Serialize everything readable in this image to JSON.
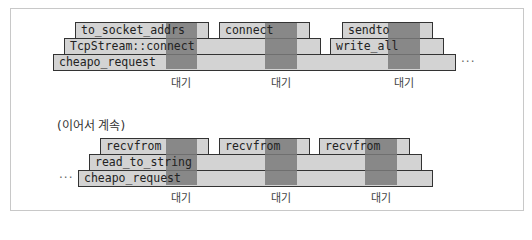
{
  "diagram": {
    "top": {
      "rows": [
        {
          "bars": [
            {
              "label": "to_socket_addrs",
              "x": 75,
              "w": 133
            },
            {
              "label": "connect",
              "x": 219,
              "w": 90
            },
            {
              "label": "sendto",
              "x": 342,
              "w": 90
            }
          ]
        },
        {
          "bars": [
            {
              "label": "TcpStream::connect",
              "x": 64,
              "w": 256
            },
            {
              "label": "write_all",
              "x": 330,
              "w": 113
            }
          ]
        },
        {
          "bars": [
            {
              "label": "cheapo_request",
              "x": 53,
              "w": 402
            }
          ]
        }
      ],
      "wait_label": "대기",
      "trailing_ellipsis": "···"
    },
    "continuation_label": "(이어서 계속)",
    "bottom": {
      "rows": [
        {
          "bars": [
            {
              "label": "recvfrom",
              "x": 100,
              "w": 108
            },
            {
              "label": "recvfrom",
              "x": 219,
              "w": 90
            },
            {
              "label": "recvfrom",
              "x": 319,
              "w": 90
            }
          ]
        },
        {
          "bars": [
            {
              "label": "read_to_string",
              "x": 89,
              "w": 332
            }
          ]
        },
        {
          "bars": [
            {
              "label": "cheapo_request",
              "x": 78,
              "w": 354
            }
          ]
        }
      ],
      "wait_label": "대기",
      "leading_ellipsis": "···"
    },
    "colors": {
      "bar_fill": "#d3d3d3",
      "wait_band": "#7a7a7a",
      "border": "#333333"
    }
  }
}
